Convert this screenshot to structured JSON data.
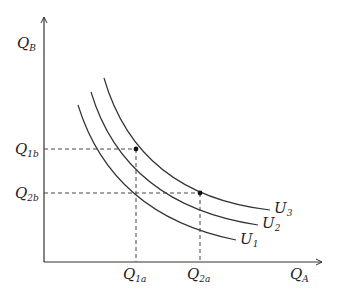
{
  "diagram": {
    "type": "indifference-curves",
    "axes": {
      "x_label": {
        "main": "Q",
        "sub": "A"
      },
      "y_label": {
        "main": "Q",
        "sub": "B"
      }
    },
    "curves": [
      {
        "name": "U1",
        "label": {
          "main": "U",
          "sub": "1"
        }
      },
      {
        "name": "U2",
        "label": {
          "main": "U",
          "sub": "2"
        }
      },
      {
        "name": "U3",
        "label": {
          "main": "U",
          "sub": "3"
        }
      }
    ],
    "points": [
      {
        "name": "bundle-1",
        "x_label": {
          "main": "Q",
          "sub": "1a"
        },
        "y_label": {
          "main": "Q",
          "sub": "1b"
        },
        "on_curve": "U3"
      },
      {
        "name": "bundle-2",
        "x_label": {
          "main": "Q",
          "sub": "2a"
        },
        "y_label": {
          "main": "Q",
          "sub": "2b"
        },
        "on_curve": "U3"
      }
    ],
    "colors": {
      "line": "#333333",
      "dashed": "#444444",
      "point": "#111111"
    }
  }
}
